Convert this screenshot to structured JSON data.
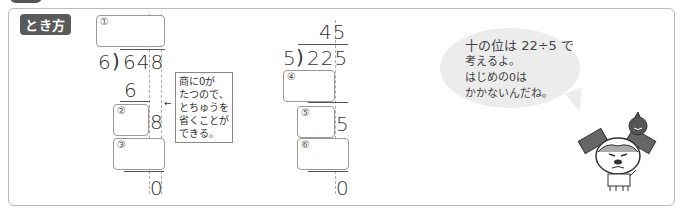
{
  "label": "とき方",
  "problem1": {
    "divisor": "6",
    "dividend": "648",
    "boxes": [
      {
        "num": "①"
      },
      {
        "num": "②"
      },
      {
        "num": "③"
      }
    ],
    "step1": "6",
    "step2": "8",
    "remainder": "0"
  },
  "note": {
    "lines": [
      "商に0が",
      "たつので、",
      "とちゅうを",
      "省くことが",
      "できる。"
    ],
    "arrow": "←"
  },
  "problem2": {
    "quotient": "45",
    "divisor": "5",
    "dividend": "225",
    "boxes": [
      {
        "num": "④"
      },
      {
        "num": "⑤"
      },
      {
        "num": "⑥"
      }
    ],
    "step2": "5",
    "remainder": "0"
  },
  "bubble": {
    "lines": [
      "十の位は 22÷5 で",
      "考えるよ。",
      "はじめの0は",
      "かかないんだね。"
    ]
  },
  "colors": {
    "label_bg": "#5a5a5a",
    "bubble_bg": "#ececec",
    "border": "#bbbbbb"
  }
}
